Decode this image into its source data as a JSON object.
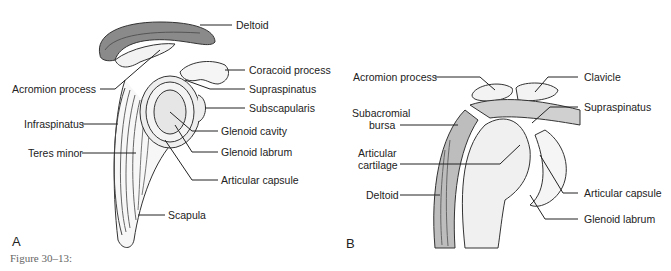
{
  "figure": {
    "caption": "Figure 30–13:",
    "panels": [
      {
        "id": "A",
        "letter": "A",
        "labels": [
          {
            "text": "Deltoid"
          },
          {
            "text": "Coracoid process"
          },
          {
            "text": "Acromion process"
          },
          {
            "text": "Supraspinatus"
          },
          {
            "text": "Subscapularis"
          },
          {
            "text": "Infraspinatus"
          },
          {
            "text": "Glenoid cavity"
          },
          {
            "text": "Teres minor"
          },
          {
            "text": "Glenoid labrum"
          },
          {
            "text": "Articular capsule"
          },
          {
            "text": "Scapula"
          }
        ]
      },
      {
        "id": "B",
        "letter": "B",
        "labels": [
          {
            "text": "Acromion process"
          },
          {
            "text": "Clavicle"
          },
          {
            "text": "Subacromial"
          },
          {
            "text": "bursa"
          },
          {
            "text": "Supraspinatus"
          },
          {
            "text": "Articular"
          },
          {
            "text": "cartilage"
          },
          {
            "text": "Deltoid"
          },
          {
            "text": "Articular capsule"
          },
          {
            "text": "Glenoid labrum"
          }
        ]
      }
    ]
  }
}
